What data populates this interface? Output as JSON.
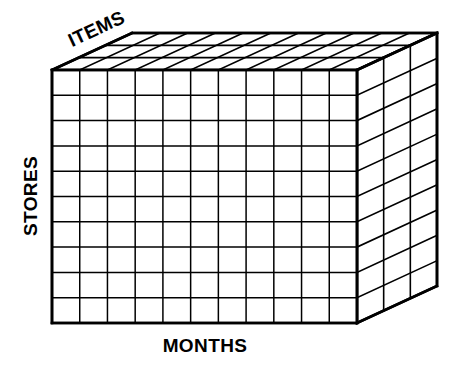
{
  "figure": {
    "type": "3d-data-cube-diagram",
    "background_color": "#ffffff",
    "line_color": "#000000",
    "face_fill": "#ffffff"
  },
  "axes": {
    "x": {
      "name": "months-axis",
      "label": "MONTHS",
      "divisions": 11,
      "orientation": "horizontal",
      "rotation_deg": 0,
      "label_position": {
        "x": 205,
        "y": 347
      }
    },
    "y": {
      "name": "stores-axis",
      "label": "STORES",
      "divisions": 10,
      "orientation": "vertical",
      "rotation_deg": -90,
      "label_position": {
        "x": 32,
        "y": 196
      }
    },
    "z": {
      "name": "items-axis",
      "label": "ITEMS",
      "divisions": 3,
      "orientation": "depth",
      "rotation_deg": -25,
      "label_position": {
        "x": 97,
        "y": 30
      }
    }
  },
  "geometry": {
    "front_top_left": {
      "x": 52,
      "y": 70
    },
    "front_bottom_right": {
      "x": 357,
      "y": 323
    },
    "depth_offset": {
      "dx": 80,
      "dy": -37
    },
    "stroke_width_outer": 2.6,
    "stroke_width_inner": 1.5,
    "stroke_width_depth": 1.6
  },
  "chart_data": {
    "type": "table",
    "title": "",
    "dimensions": [
      {
        "axis": "x",
        "label": "MONTHS",
        "cells": 11
      },
      {
        "axis": "y",
        "label": "STORES",
        "cells": 10
      },
      {
        "axis": "z",
        "label": "ITEMS",
        "cells": 3
      }
    ],
    "total_cells": 330,
    "xlabel": "MONTHS",
    "ylabel": "STORES",
    "zlabel": "ITEMS"
  }
}
